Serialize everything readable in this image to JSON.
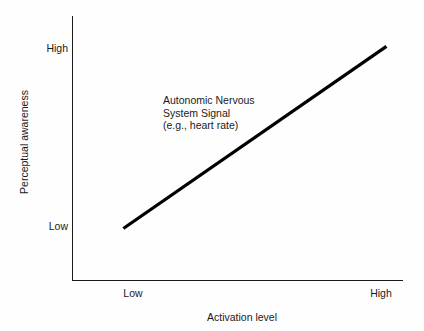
{
  "chart_data": {
    "type": "line",
    "title": "",
    "xlabel": "Activation level",
    "ylabel": "Perceptual awareness",
    "x_ticks": [
      "Low",
      "High"
    ],
    "y_ticks": [
      "Low",
      "High"
    ],
    "xlim": [
      0,
      1
    ],
    "ylim": [
      0,
      1
    ],
    "grid": false,
    "legend": "none",
    "series": [
      {
        "name": "Autonomic Nervous System Signal (e.g., heart rate)",
        "x": [
          0.155,
          0.95
        ],
        "y": [
          0.195,
          0.885
        ],
        "color": "#000000",
        "line_width": 3.2
      }
    ],
    "annotations": [
      {
        "name": "series-label",
        "lines": [
          "Autonomic Nervous",
          "System Signal",
          "(e.g., heart rate)"
        ],
        "x": 0.275,
        "y": 0.705
      }
    ]
  },
  "axes": {
    "y": {
      "title": "Perceptual awareness",
      "tick_high": "High",
      "tick_low": "Low"
    },
    "x": {
      "title": "Activation level",
      "tick_low": "Low",
      "tick_high": "High"
    }
  },
  "annotation": {
    "line1": "Autonomic Nervous",
    "line2": "System Signal",
    "line3": "(e.g., heart rate)"
  },
  "colors": {
    "line": "#000000",
    "axis": "#1a1a1a",
    "text": "#1a1a1a",
    "background": "#fefefe"
  }
}
